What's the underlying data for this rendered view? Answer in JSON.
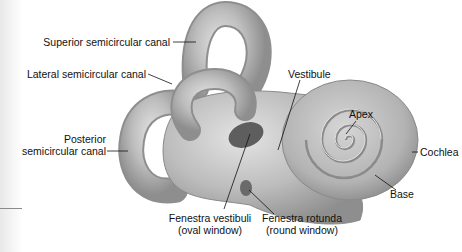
{
  "diagram": {
    "colors": {
      "structure_fill": "#b9b9b9",
      "structure_shadow": "#8c8c8c",
      "structure_highlight": "#e6e6e6",
      "leader_line": "#111111",
      "background": "#ffffff"
    },
    "labels": {
      "superior_canal": "Superior semicircular canal",
      "lateral_canal": "Lateral semicircular canal",
      "posterior_canal_line1": "Posterior",
      "posterior_canal_line2": "semicircular canal",
      "vestibule": "Vestibule",
      "apex": "Apex",
      "cochlea": "Cochlea",
      "base": "Base",
      "fenestra_vestibuli_line1": "Fenestra vestibuli",
      "fenestra_vestibuli_line2": "(oval window)",
      "fenestra_rotunda_line1": "Fenestra rotunda",
      "fenestra_rotunda_line2": "(round window)"
    }
  }
}
